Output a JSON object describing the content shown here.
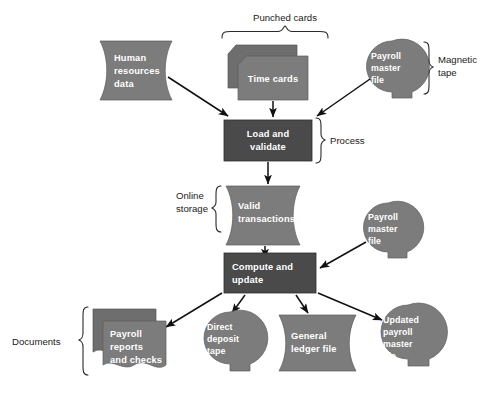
{
  "diagram": {
    "colors": {
      "shape_fill": "#7c7c7c",
      "shape_fill_back": "#6e6e6e",
      "process_fill": "#4a4a4a",
      "label_text": "#ffffff",
      "annotation_text": "#1a1a1a",
      "connector": "#111111",
      "background": "#ffffff"
    },
    "nodes": [
      {
        "id": "human-resources-data",
        "label": "Human resources data",
        "lines": [
          "Human",
          "resources",
          "data"
        ],
        "symbol": "online-storage"
      },
      {
        "id": "time-cards",
        "label": "Time cards",
        "lines": [
          "Time cards"
        ],
        "symbol": "punched-card-stack"
      },
      {
        "id": "payroll-master-file-input",
        "label": "Payroll master file",
        "lines": [
          "Payroll",
          "master",
          "file"
        ],
        "symbol": "magnetic-tape"
      },
      {
        "id": "load-and-validate",
        "label": "Load and validate",
        "lines": [
          "Load and",
          "validate"
        ],
        "symbol": "process"
      },
      {
        "id": "valid-transactions",
        "label": "Valid transactions",
        "lines": [
          "Valid",
          "transactions"
        ],
        "symbol": "online-storage"
      },
      {
        "id": "payroll-master-file-update",
        "label": "Payroll master file",
        "lines": [
          "Payroll",
          "master",
          "file"
        ],
        "symbol": "magnetic-tape"
      },
      {
        "id": "compute-and-update",
        "label": "Compute and update",
        "lines": [
          "Compute and",
          "update"
        ],
        "symbol": "process"
      },
      {
        "id": "payroll-reports-and-checks",
        "label": "Payroll reports and checks",
        "lines": [
          "Payroll",
          "reports",
          "and checks"
        ],
        "symbol": "document-stack"
      },
      {
        "id": "direct-deposit-tape",
        "label": "Direct deposit tape",
        "lines": [
          "Direct",
          "deposit",
          "tape"
        ],
        "symbol": "magnetic-tape"
      },
      {
        "id": "general-ledger-file",
        "label": "General ledger file",
        "lines": [
          "General",
          "ledger file"
        ],
        "symbol": "online-storage"
      },
      {
        "id": "updated-payroll-master-file",
        "label": "Updated payroll master file",
        "lines": [
          "Updated",
          "payroll",
          "master",
          "file"
        ],
        "symbol": "magnetic-tape"
      }
    ],
    "annotations": [
      {
        "id": "punched-cards",
        "label": "Punched cards",
        "lines": [
          "Punched cards"
        ]
      },
      {
        "id": "magnetic-tape",
        "label": "Magnetic tape",
        "lines": [
          "Magnetic",
          "tape"
        ]
      },
      {
        "id": "process",
        "label": "Process",
        "lines": [
          "Process"
        ]
      },
      {
        "id": "online-storage",
        "label": "Online storage",
        "lines": [
          "Online",
          "storage"
        ]
      },
      {
        "id": "documents",
        "label": "Documents",
        "lines": [
          "Documents"
        ]
      }
    ],
    "edges": [
      {
        "from": "human-resources-data",
        "to": "load-and-validate"
      },
      {
        "from": "time-cards",
        "to": "load-and-validate"
      },
      {
        "from": "payroll-master-file-input",
        "to": "load-and-validate"
      },
      {
        "from": "load-and-validate",
        "to": "valid-transactions"
      },
      {
        "from": "valid-transactions",
        "to": "compute-and-update"
      },
      {
        "from": "payroll-master-file-update",
        "to": "compute-and-update"
      },
      {
        "from": "compute-and-update",
        "to": "payroll-reports-and-checks"
      },
      {
        "from": "compute-and-update",
        "to": "direct-deposit-tape"
      },
      {
        "from": "compute-and-update",
        "to": "general-ledger-file"
      },
      {
        "from": "compute-and-update",
        "to": "updated-payroll-master-file"
      }
    ]
  }
}
